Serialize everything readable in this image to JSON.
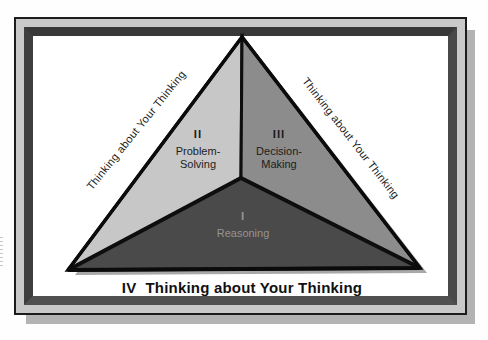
{
  "figure": {
    "side_label_left": "Thinking about Your Thinking",
    "side_label_right": "Thinking about Your Thinking",
    "regions": {
      "problem_solving": {
        "numeral": "II",
        "line1": "Problem-",
        "line2": "Solving"
      },
      "decision_making": {
        "numeral": "III",
        "line1": "Decision-",
        "line2": "Making"
      },
      "reasoning": {
        "numeral": "I",
        "line1": "Reasoning"
      }
    },
    "caption": {
      "numeral": "IV",
      "text": "Thinking about Your Thinking"
    },
    "colors": {
      "frame_light": "#c9c9c9",
      "frame_dark": "#424242",
      "region_left": "#c7c7c7",
      "region_right": "#8c8c8c",
      "region_bottom": "#4a4a4a",
      "triangle_shadow": "#a8a8a8",
      "page_shadow": "#b3b3b3",
      "reasoning_text": "#949494"
    }
  }
}
